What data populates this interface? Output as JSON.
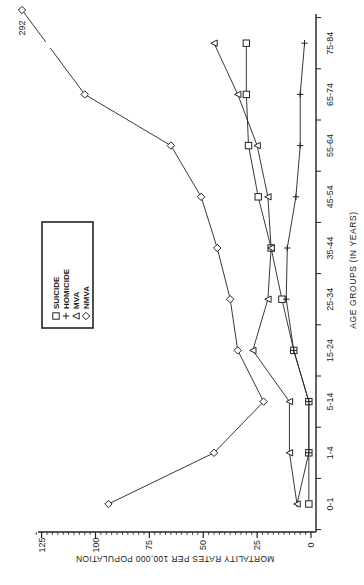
{
  "chart_data": {
    "type": "line",
    "orientation": "rotated-90-ccw",
    "title": "",
    "xlabel": "AGE GROUPS (IN YEARS)",
    "ylabel": "MORTALITY RATES PER 100,000 POPULATION",
    "categories": [
      "0-1",
      "1-4",
      "5-14",
      "15-24",
      "25-34",
      "35-44",
      "45-54",
      "55-64",
      "65-74",
      "75-84"
    ],
    "ylim": [
      0,
      125
    ],
    "yticks": [
      0,
      25,
      50,
      75,
      100,
      125
    ],
    "grid": false,
    "legend_position": "inside-upper-left",
    "series": [
      {
        "name": "SUICIDE",
        "marker": "square",
        "values": [
          1,
          1,
          1,
          8,
          13.5,
          18.5,
          24.5,
          29,
          30,
          30
        ]
      },
      {
        "name": "HOMICIDE",
        "marker": "plus",
        "values": [
          6.5,
          1,
          1,
          8,
          11.5,
          11,
          7,
          5,
          5,
          3
        ]
      },
      {
        "name": "MVA",
        "marker": "triangle",
        "values": [
          6.5,
          10,
          10,
          27,
          20,
          18.5,
          20,
          25,
          34,
          45
        ]
      },
      {
        "name": "NMVA",
        "marker": "diamond",
        "values": [
          94,
          45,
          22,
          34,
          37.5,
          43.5,
          51,
          65,
          105,
          292
        ]
      }
    ],
    "annotations": [
      {
        "text": "292",
        "category": "75-84",
        "series": "NMVA",
        "note": "off-scale value, axis break"
      }
    ]
  }
}
